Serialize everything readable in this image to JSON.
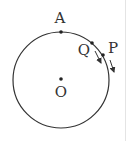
{
  "diagram": {
    "type": "circle-motion",
    "stroke_color": "#333333",
    "background": "#ffffff",
    "circle": {
      "cx": 61,
      "cy": 80,
      "r": 48
    },
    "points": [
      {
        "id": "A",
        "label": "A",
        "x": 61,
        "y": 31,
        "label_x": 60,
        "label_y": 23
      },
      {
        "id": "Q",
        "label": "Q",
        "x": 92,
        "y": 43,
        "label_x": 84,
        "label_y": 55
      },
      {
        "id": "P",
        "label": "P",
        "x": 103,
        "y": 55,
        "label_x": 113,
        "label_y": 53
      },
      {
        "id": "O",
        "label": "O",
        "x": 61,
        "y": 78,
        "label_x": 61,
        "label_y": 97
      }
    ],
    "arrows": [
      {
        "of": "Q",
        "x1": 95,
        "y1": 51,
        "x2": 101,
        "y2": 63
      },
      {
        "of": "P",
        "x1": 110,
        "y1": 60,
        "x2": 114,
        "y2": 72
      }
    ]
  },
  "labels": {
    "A": "A",
    "Q": "Q",
    "P": "P",
    "O": "O"
  }
}
